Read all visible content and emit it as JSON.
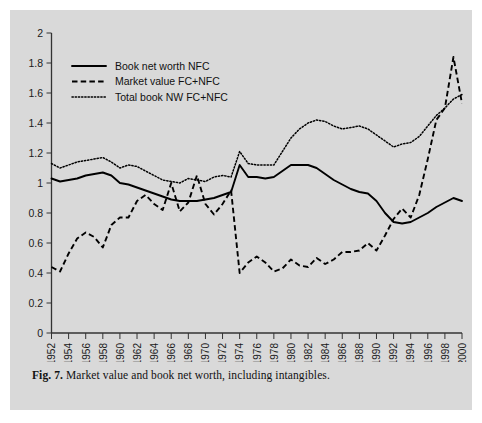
{
  "figure": {
    "caption_label": "Fig. 7.",
    "caption_text": "Market value and book net worth, including intangibles.",
    "panel_color": "#d9d9d9",
    "page_color": "#ffffff"
  },
  "chart_data": {
    "type": "line",
    "title": "",
    "xlabel": "",
    "ylabel": "",
    "xlim": [
      1952,
      2000
    ],
    "ylim": [
      0,
      2
    ],
    "ytick_labels": [
      "0",
      "0.2",
      "0.4",
      "0.6",
      "0.8",
      "1",
      "1.2",
      "1.4",
      "1.6",
      "1.8",
      "2"
    ],
    "ytick_values": [
      0,
      0.2,
      0.4,
      0.6,
      0.8,
      1.0,
      1.2,
      1.4,
      1.6,
      1.8,
      2.0
    ],
    "xtick_labels": [
      "1952",
      "1954",
      "1956",
      "1958",
      "1960",
      "1962",
      "1964",
      "1966",
      "1968",
      "1970",
      "1972",
      "1974",
      "1976",
      "1978",
      "1980",
      "1982",
      "1984",
      "1986",
      "1988",
      "1990",
      "1992",
      "1994",
      "1996",
      "1998",
      "2000"
    ],
    "xtick_values": [
      1952,
      1954,
      1956,
      1958,
      1960,
      1962,
      1964,
      1966,
      1968,
      1970,
      1972,
      1974,
      1976,
      1978,
      1980,
      1982,
      1984,
      1986,
      1988,
      1990,
      1992,
      1994,
      1996,
      1998,
      2000
    ],
    "grid": false,
    "legend_position": "upper-left",
    "x": [
      1952,
      1953,
      1954,
      1955,
      1956,
      1957,
      1958,
      1959,
      1960,
      1961,
      1962,
      1963,
      1964,
      1965,
      1966,
      1967,
      1968,
      1969,
      1970,
      1971,
      1972,
      1973,
      1974,
      1975,
      1976,
      1977,
      1978,
      1979,
      1980,
      1981,
      1982,
      1983,
      1984,
      1985,
      1986,
      1987,
      1988,
      1989,
      1990,
      1991,
      1992,
      1993,
      1994,
      1995,
      1996,
      1997,
      1998,
      1999,
      2000
    ],
    "series": [
      {
        "name": "Book net worth NFC",
        "style": "solid",
        "color": "#000000",
        "values": [
          1.03,
          1.01,
          1.02,
          1.03,
          1.05,
          1.06,
          1.07,
          1.05,
          1.0,
          0.99,
          0.97,
          0.95,
          0.93,
          0.91,
          0.89,
          0.88,
          0.88,
          0.88,
          0.89,
          0.9,
          0.92,
          0.94,
          1.12,
          1.04,
          1.04,
          1.03,
          1.04,
          1.08,
          1.12,
          1.12,
          1.12,
          1.1,
          1.06,
          1.02,
          0.99,
          0.96,
          0.94,
          0.93,
          0.88,
          0.8,
          0.74,
          0.73,
          0.74,
          0.77,
          0.8,
          0.84,
          0.87,
          0.9,
          0.88
        ]
      },
      {
        "name": "Market value FC+NFC",
        "style": "dashed",
        "color": "#000000",
        "values": [
          0.44,
          0.41,
          0.53,
          0.63,
          0.67,
          0.64,
          0.57,
          0.72,
          0.77,
          0.77,
          0.88,
          0.92,
          0.86,
          0.82,
          1.0,
          0.81,
          0.87,
          1.05,
          0.86,
          0.79,
          0.86,
          0.95,
          0.4,
          0.47,
          0.51,
          0.47,
          0.41,
          0.43,
          0.49,
          0.45,
          0.44,
          0.5,
          0.46,
          0.49,
          0.54,
          0.54,
          0.55,
          0.6,
          0.55,
          0.65,
          0.76,
          0.83,
          0.77,
          0.92,
          1.16,
          1.42,
          1.5,
          1.84,
          1.53
        ]
      },
      {
        "name": "Total book NW FC+NFC",
        "style": "dotted",
        "color": "#000000",
        "values": [
          1.13,
          1.1,
          1.12,
          1.14,
          1.15,
          1.16,
          1.17,
          1.14,
          1.1,
          1.12,
          1.11,
          1.08,
          1.05,
          1.02,
          1.01,
          1.0,
          1.03,
          1.02,
          1.01,
          1.04,
          1.05,
          1.04,
          1.21,
          1.13,
          1.12,
          1.12,
          1.12,
          1.21,
          1.3,
          1.36,
          1.4,
          1.42,
          1.41,
          1.38,
          1.36,
          1.37,
          1.38,
          1.36,
          1.32,
          1.28,
          1.24,
          1.26,
          1.27,
          1.31,
          1.38,
          1.45,
          1.5,
          1.56,
          1.59
        ]
      }
    ],
    "annotations": []
  },
  "legend": {
    "items": [
      {
        "label": "Book net worth NFC",
        "style": "solid"
      },
      {
        "label": "Market value FC+NFC",
        "style": "dashed"
      },
      {
        "label": "Total book NW FC+NFC",
        "style": "dotted"
      }
    ]
  }
}
